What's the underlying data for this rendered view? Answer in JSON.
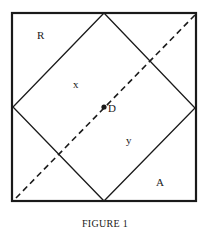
{
  "figure": {
    "caption": "FIGURE 1",
    "outer_square": {
      "x1": 12,
      "y1": 13,
      "x2": 196,
      "y2": 201
    },
    "diamond": {
      "top": [
        104,
        13
      ],
      "right": [
        195,
        108
      ],
      "bottom": [
        104,
        201
      ],
      "left": [
        13,
        107
      ]
    },
    "diagonal": {
      "from": [
        16,
        198
      ],
      "to": [
        195,
        15
      ],
      "style": "dashed"
    },
    "center_point": {
      "x": 104,
      "y": 107,
      "label": "D"
    },
    "region_labels": {
      "R": {
        "text": "R",
        "x": 41,
        "y": 39
      },
      "x": {
        "text": "x",
        "x": 76,
        "y": 88
      },
      "y": {
        "text": "y",
        "x": 129,
        "y": 144
      },
      "A": {
        "text": "A",
        "x": 160,
        "y": 185
      }
    },
    "colors": {
      "stroke": "#1a1a1a",
      "background": "#ffffff"
    }
  }
}
